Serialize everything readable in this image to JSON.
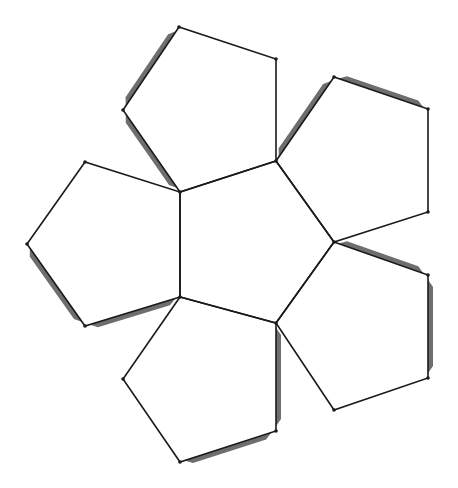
{
  "diagram": {
    "title": "",
    "colors": {
      "background": "#ffffff",
      "edge": "#1a1a1a",
      "tab": "#6e6e6e"
    },
    "center_pentagon": [
      [
        180,
        192
      ],
      [
        276,
        161
      ],
      [
        334,
        242
      ],
      [
        276,
        323
      ],
      [
        180,
        297
      ]
    ],
    "outer_pentagons": [
      {
        "name": "top",
        "points": [
          [
            180,
            192
          ],
          [
            123,
            110
          ],
          [
            179,
            27
          ],
          [
            276,
            59
          ],
          [
            276,
            161
          ]
        ]
      },
      {
        "name": "upper-right",
        "points": [
          [
            276,
            161
          ],
          [
            334,
            77
          ],
          [
            428,
            109
          ],
          [
            428,
            212
          ],
          [
            334,
            242
          ]
        ]
      },
      {
        "name": "lower-right",
        "points": [
          [
            334,
            242
          ],
          [
            428,
            275
          ],
          [
            428,
            378
          ],
          [
            334,
            410
          ],
          [
            276,
            323
          ]
        ]
      },
      {
        "name": "bottom",
        "points": [
          [
            276,
            323
          ],
          [
            276,
            431
          ],
          [
            180,
            462
          ],
          [
            123,
            379
          ],
          [
            180,
            297
          ]
        ]
      },
      {
        "name": "left",
        "points": [
          [
            180,
            297
          ],
          [
            85,
            326
          ],
          [
            27,
            244
          ],
          [
            85,
            162
          ],
          [
            180,
            192
          ]
        ]
      }
    ],
    "tabs": [
      {
        "edge": [
          [
            179,
            27
          ],
          [
            123,
            110
          ]
        ],
        "side": "outer"
      },
      {
        "edge": [
          [
            123,
            110
          ],
          [
            180,
            192
          ]
        ],
        "side": "outer"
      },
      {
        "edge": [
          [
            334,
            77
          ],
          [
            276,
            161
          ]
        ],
        "side": "outer"
      },
      {
        "edge": [
          [
            334,
            77
          ],
          [
            428,
            109
          ]
        ],
        "side": "outer"
      },
      {
        "edge": [
          [
            334,
            242
          ],
          [
            428,
            275
          ]
        ],
        "side": "outer"
      },
      {
        "edge": [
          [
            428,
            275
          ],
          [
            428,
            378
          ]
        ],
        "side": "outer"
      },
      {
        "edge": [
          [
            276,
            323
          ],
          [
            276,
            431
          ]
        ],
        "side": "outer"
      },
      {
        "edge": [
          [
            276,
            431
          ],
          [
            180,
            462
          ]
        ],
        "side": "outer"
      },
      {
        "edge": [
          [
            27,
            244
          ],
          [
            85,
            326
          ]
        ],
        "side": "outer"
      },
      {
        "edge": [
          [
            85,
            326
          ],
          [
            180,
            297
          ]
        ],
        "side": "outer"
      }
    ]
  }
}
